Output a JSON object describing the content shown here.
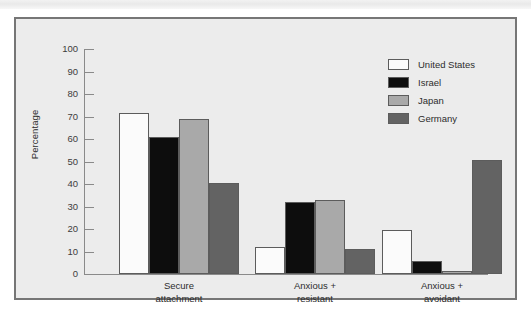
{
  "figure": {
    "border_color": "#767676",
    "background_color": "#ececec"
  },
  "chart_data": {
    "type": "bar",
    "title": "",
    "xlabel": "",
    "ylabel": "Percentage",
    "ylim": [
      0,
      100
    ],
    "ytick_values": [
      100,
      90,
      80,
      70,
      60,
      50,
      40,
      30,
      20,
      10,
      0
    ],
    "ytick_labels": [
      "100",
      "90",
      "80",
      "70",
      "60",
      "50",
      "40",
      "30",
      "20",
      "10",
      "0"
    ],
    "grid": false,
    "legend_position": "top-right",
    "categories": [
      "Secure\nattachment",
      "Anxious +\nresistant",
      "Anxious +\navoidant"
    ],
    "series": [
      {
        "name": "United States",
        "color": "#fbfbfb",
        "values": [
          71.5,
          12,
          19.5
        ]
      },
      {
        "name": "Israel",
        "color": "#0d0d0d",
        "values": [
          61,
          32,
          6
        ]
      },
      {
        "name": "Japan",
        "color": "#a9a9a9",
        "values": [
          69,
          33,
          1.2
        ]
      },
      {
        "name": "Germany",
        "color": "#636363",
        "values": [
          40.5,
          11,
          50.5
        ]
      }
    ]
  }
}
